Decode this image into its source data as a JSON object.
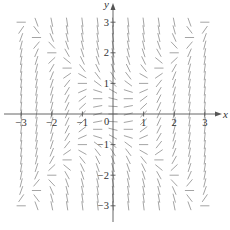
{
  "figure": {
    "type": "slope_field",
    "equation": "dy/dx = x^2 - y^2",
    "x_axis_label": "x",
    "y_axis_label": "y",
    "x_range": [
      -3,
      3
    ],
    "y_range": [
      -3,
      3
    ],
    "x_ticks": [
      {
        "value": -3,
        "label": "−3"
      },
      {
        "value": -2,
        "label": "−2"
      },
      {
        "value": -1,
        "label": "−1"
      },
      {
        "value": 1,
        "label": "1"
      },
      {
        "value": 2,
        "label": "2"
      },
      {
        "value": 3,
        "label": "3"
      }
    ],
    "y_ticks": [
      {
        "value": 3,
        "label": "3"
      },
      {
        "value": 2,
        "label": "2"
      },
      {
        "value": 1,
        "label": "1"
      },
      {
        "value": -1,
        "label": "−1"
      },
      {
        "value": -2,
        "label": "−2"
      },
      {
        "value": -3,
        "label": "−3"
      }
    ],
    "origin_label": "0",
    "grid": {
      "x_start": -3,
      "x_end": 3,
      "x_step": 0.5,
      "y_start": -3,
      "y_end": 3,
      "y_step": 0.25
    },
    "colors": {
      "segments": "#9a9a9a",
      "axes": "#555555",
      "text": "#333333"
    }
  }
}
